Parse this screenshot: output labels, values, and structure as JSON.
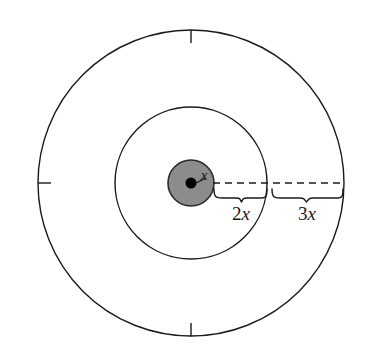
{
  "figure": {
    "type": "geometry-diagram",
    "center": {
      "x": 191,
      "y": 183
    },
    "background_color": "#ffffff",
    "stroke_color": "#1a1a1a",
    "shaded_fill_color": "#8c8c8c",
    "center_dot_color": "#000000",
    "circles": [
      {
        "name": "inner-shaded-circle",
        "radius": 23,
        "filled": true,
        "fill": "#8c8c8c",
        "label": "x"
      },
      {
        "name": "middle-circle",
        "radius": 76,
        "filled": false,
        "fill": "none",
        "label": "2x"
      },
      {
        "name": "outer-circle",
        "radius": 153,
        "filled": false,
        "fill": "none",
        "label": "3x"
      }
    ],
    "labels": {
      "inner_radius": "x",
      "middle_band": "2x",
      "outer_band": "3x",
      "middle_band_coefficient": "2",
      "middle_band_variable": "x",
      "outer_band_coefficient": "3",
      "outer_band_variable": "x"
    },
    "radius_line": {
      "name": "dashed-radius-line",
      "style": "dashed",
      "from_x": 214,
      "to_x": 344,
      "y": 183
    },
    "tick_marks": [
      {
        "name": "tick-top",
        "position": "top"
      },
      {
        "name": "tick-left",
        "position": "left"
      },
      {
        "name": "tick-bottom",
        "position": "bottom"
      }
    ],
    "braces": [
      {
        "name": "brace-2x",
        "from_x": 214,
        "to_x": 267,
        "label": "2x"
      },
      {
        "name": "brace-3x",
        "from_x": 271,
        "to_x": 344,
        "label": "3x"
      }
    ]
  }
}
